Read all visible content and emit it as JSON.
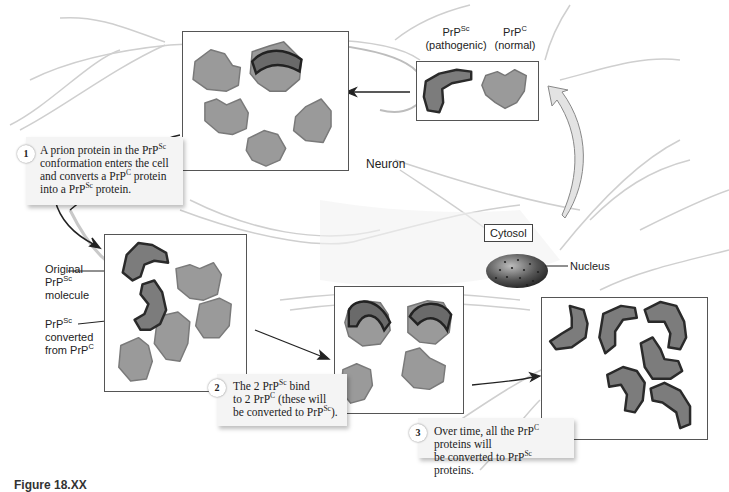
{
  "figure": {
    "figure_label": "Figure 18.XX",
    "colors": {
      "prp_c_fill": "#9a9a9a",
      "prp_sc_fill": "#7c7c7c",
      "prp_sc_edge": "#2a2a2a",
      "neuron_line": "#c8c8c8",
      "arrow": "#222222",
      "callout_bg": "#f4f4f4"
    }
  },
  "legend_panel": {
    "prp_sc_label": "PrP",
    "prp_sc_sup": "Sc",
    "prp_sc_desc": "(pathogenic)",
    "prp_c_label": "PrP",
    "prp_c_sup": "C",
    "prp_c_desc": "(normal)"
  },
  "labels": {
    "neuron": "Neuron",
    "cytosol": "Cytosol",
    "nucleus": "Nucleus",
    "original_line1": "Original",
    "original_line2_base": "PrP",
    "original_line2_sup": "Sc",
    "original_line3": "molecule",
    "converted_line1_base": "PrP",
    "converted_line1_sup": "Sc",
    "converted_line2": "converted",
    "converted_line3_base": "from PrP",
    "converted_line3_sup": "C"
  },
  "steps": [
    {
      "number": "1",
      "lines": [
        {
          "t1": "A prion protein in the PrP",
          "sup1": "Sc",
          "t2": ""
        },
        {
          "t1": "conformation enters the cell",
          "sup1": "",
          "t2": ""
        },
        {
          "t1": "and converts a PrP",
          "sup1": "C",
          "t2": " protein"
        },
        {
          "t1": "into a PrP",
          "sup1": "Sc",
          "t2": " protein."
        }
      ]
    },
    {
      "number": "2",
      "lines": [
        {
          "t1": "The 2 PrP",
          "sup1": "Sc",
          "t2": " bind"
        },
        {
          "t1": "to 2 PrP",
          "sup1": "C",
          "t2": " (these will"
        },
        {
          "t1": "be converted to PrP",
          "sup1": "Sc",
          "t2": ")."
        }
      ]
    },
    {
      "number": "3",
      "lines": [
        {
          "t1": "Over time, all the PrP",
          "sup1": "C",
          "t2": " proteins will"
        },
        {
          "t1": "be converted to PrP",
          "sup1": "Sc",
          "t2": " proteins."
        }
      ]
    }
  ],
  "panels": [
    {
      "id": "legend",
      "prp_sc_count": 1,
      "prp_c_count": 1
    },
    {
      "id": "step1",
      "prp_sc_count": 1,
      "prp_c_count": 4
    },
    {
      "id": "step1b",
      "prp_sc_count": 2,
      "prp_c_count": 4
    },
    {
      "id": "step2",
      "prp_sc_count": 2,
      "prp_c_count": 2
    },
    {
      "id": "step3",
      "prp_sc_count": 6,
      "prp_c_count": 0
    }
  ]
}
